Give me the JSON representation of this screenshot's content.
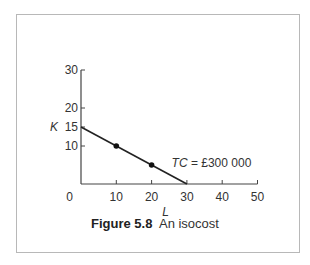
{
  "figure": {
    "number_label": "Figure 5.8",
    "title": "An isocost"
  },
  "chart_data": {
    "type": "line",
    "xlabel": "L",
    "ylabel": "K",
    "xlim": [
      0,
      50
    ],
    "ylim": [
      0,
      30
    ],
    "x_ticks": [
      0,
      10,
      20,
      30,
      40,
      50
    ],
    "y_ticks": [
      10,
      15,
      20,
      30
    ],
    "grid": false,
    "series": [
      {
        "name": "TC = £300 000",
        "line": [
          [
            0,
            15
          ],
          [
            30,
            0
          ]
        ],
        "points": [
          [
            10,
            10
          ],
          [
            20,
            5
          ]
        ]
      }
    ],
    "annotations": [
      {
        "text": "TC = £300 000",
        "x": 20,
        "y": 5
      }
    ]
  },
  "labels": {
    "origin": "0",
    "x_axis": "L",
    "y_axis": "K",
    "annotation_italic": "TC",
    "annotation_rest": " = £300 000"
  }
}
